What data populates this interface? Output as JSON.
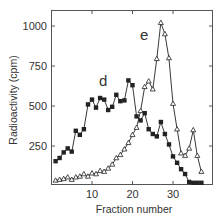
{
  "chart_data": {
    "type": "line",
    "title": "",
    "xlabel": "Fraction number",
    "ylabel": "Radioactivity (cpm)",
    "xlim": [
      0,
      39
    ],
    "ylim": [
      0,
      1100
    ],
    "x_ticks": [
      10,
      20,
      30
    ],
    "y_ticks": [
      250,
      500,
      750,
      1000
    ],
    "grid": false,
    "legend": "none (curves labeled inline)",
    "x": [
      1,
      2,
      3,
      4,
      5,
      6,
      7,
      8,
      9,
      10,
      11,
      12,
      13,
      14,
      15,
      16,
      17,
      18,
      19,
      20,
      21,
      22,
      23,
      24,
      25,
      26,
      27,
      28,
      29,
      30,
      31,
      32,
      33,
      34,
      35,
      36,
      37
    ],
    "series": [
      {
        "name": "d",
        "marker": "filled-square",
        "label_pos": [
          19.5,
          650
        ],
        "values": [
          155,
          175,
          210,
          235,
          215,
          345,
          320,
          355,
          510,
          540,
          490,
          550,
          540,
          475,
          495,
          570,
          530,
          535,
          660,
          630,
          435,
          410,
          455,
          355,
          325,
          310,
          400,
          325,
          260,
          185,
          145,
          105,
          75,
          25,
          20,
          20,
          20
        ]
      },
      {
        "name": "e",
        "marker": "open-triangle",
        "label_pos": [
          23.2,
          920
        ],
        "values": [
          35,
          40,
          45,
          55,
          40,
          55,
          60,
          75,
          60,
          80,
          75,
          95,
          90,
          110,
          135,
          175,
          195,
          230,
          270,
          320,
          365,
          470,
          620,
          655,
          605,
          795,
          1020,
          950,
          800,
          515,
          355,
          205,
          190,
          235,
          350,
          190,
          90
        ]
      }
    ]
  },
  "labels": {
    "xlabel": "Fraction number",
    "ylabel": "Radioactivity (cpm)",
    "series_d": "d",
    "series_e": "e",
    "ytick_250": "250",
    "ytick_500": "500",
    "ytick_750": "750",
    "ytick_1000": "1000",
    "xtick_10": "10",
    "xtick_20": "20",
    "xtick_30": "30"
  },
  "colors": {
    "ink": "#222222",
    "background": "#ffffff"
  }
}
